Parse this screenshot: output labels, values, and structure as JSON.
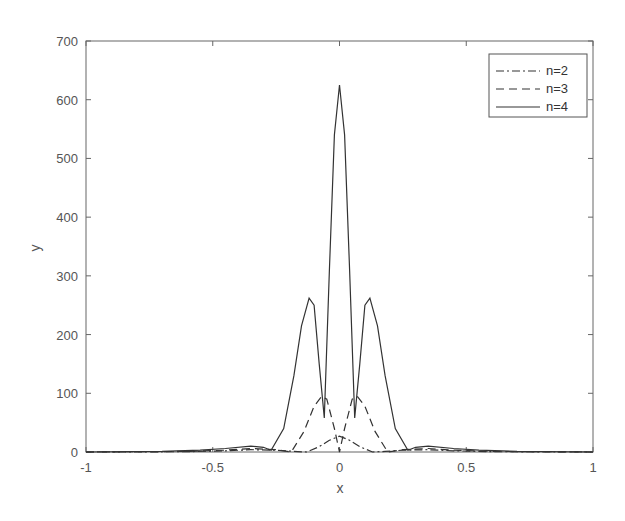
{
  "chart_data": {
    "type": "line",
    "title": "",
    "xlabel": "x",
    "ylabel": "y",
    "xlim": [
      -1,
      1
    ],
    "ylim": [
      0,
      700
    ],
    "grid": false,
    "legend_position": "upper right",
    "xticks": [
      -1,
      -0.5,
      0,
      0.5,
      1
    ],
    "xtick_labels": [
      "-1",
      "-0.5",
      "0",
      "0.5",
      "1"
    ],
    "yticks": [
      0,
      100,
      200,
      300,
      400,
      500,
      600,
      700
    ],
    "ytick_labels": [
      "0",
      "100",
      "200",
      "300",
      "400",
      "500",
      "600",
      "700"
    ],
    "series": [
      {
        "name": "n=2",
        "style": "dash-dot",
        "color": "#333333",
        "x": [
          -1,
          -0.6,
          -0.45,
          -0.35,
          -0.25,
          -0.18,
          -0.13,
          -0.08,
          -0.04,
          0,
          0.04,
          0.08,
          0.13,
          0.18,
          0.25,
          0.35,
          0.45,
          0.6,
          1
        ],
        "y": [
          0,
          0.5,
          2,
          4,
          3,
          1,
          0,
          9,
          20,
          27,
          20,
          9,
          0,
          1,
          3,
          4,
          2,
          0.5,
          0
        ]
      },
      {
        "name": "n=3",
        "style": "dashed",
        "color": "#333333",
        "x": [
          -1,
          -0.6,
          -0.45,
          -0.35,
          -0.25,
          -0.19,
          -0.14,
          -0.1,
          -0.07,
          -0.05,
          -0.02,
          0,
          0.02,
          0.05,
          0.07,
          0.1,
          0.14,
          0.19,
          0.25,
          0.35,
          0.45,
          0.6,
          1
        ],
        "y": [
          0,
          1,
          3,
          6,
          4,
          0,
          35,
          78,
          95,
          90,
          40,
          0,
          40,
          90,
          95,
          78,
          35,
          0,
          4,
          6,
          3,
          1,
          0
        ]
      },
      {
        "name": "n=4",
        "style": "solid",
        "color": "#333333",
        "x": [
          -1,
          -0.7,
          -0.55,
          -0.45,
          -0.35,
          -0.3,
          -0.27,
          -0.22,
          -0.18,
          -0.15,
          -0.12,
          -0.1,
          -0.08,
          -0.06,
          -0.04,
          -0.02,
          0,
          0.02,
          0.04,
          0.06,
          0.08,
          0.1,
          0.12,
          0.15,
          0.18,
          0.22,
          0.27,
          0.3,
          0.35,
          0.45,
          0.55,
          0.7,
          1
        ],
        "y": [
          0,
          1,
          3,
          6,
          10,
          8,
          3,
          40,
          130,
          215,
          262,
          250,
          150,
          58,
          310,
          540,
          625,
          540,
          310,
          58,
          150,
          250,
          262,
          215,
          130,
          40,
          3,
          8,
          10,
          6,
          3,
          1,
          0
        ]
      }
    ]
  },
  "legend": {
    "items": [
      {
        "label": "n=2",
        "style": "dash-dot"
      },
      {
        "label": "n=3",
        "style": "dashed"
      },
      {
        "label": "n=4",
        "style": "solid"
      }
    ]
  },
  "axes": {
    "x_label": "x",
    "y_label": "y"
  }
}
